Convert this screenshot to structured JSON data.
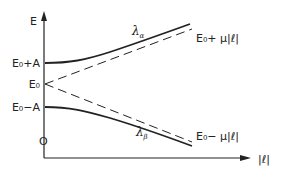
{
  "diagram": {
    "type": "energy-level avoided crossing",
    "axes": {
      "y_label": "E",
      "x_label": "|ℓ|",
      "origin_label": "O"
    },
    "y_ticks": [
      {
        "label": "E₀+A",
        "y": 63
      },
      {
        "label": "E₀",
        "y": 84
      },
      {
        "label": "E₀−A",
        "y": 107
      }
    ],
    "curves": [
      {
        "name": "λα",
        "label_main": "λ",
        "label_sub": "α",
        "style": "solid"
      },
      {
        "name": "λβ",
        "label_main": "λ",
        "label_sub": "β",
        "style": "solid"
      }
    ],
    "asymptotes": [
      {
        "label": "E₀+ μ|ℓ|",
        "style": "dashed"
      },
      {
        "label": "E₀− μ|ℓ|",
        "style": "dashed"
      }
    ],
    "colors": {
      "ink": "#222222",
      "background": "#ffffff"
    }
  }
}
